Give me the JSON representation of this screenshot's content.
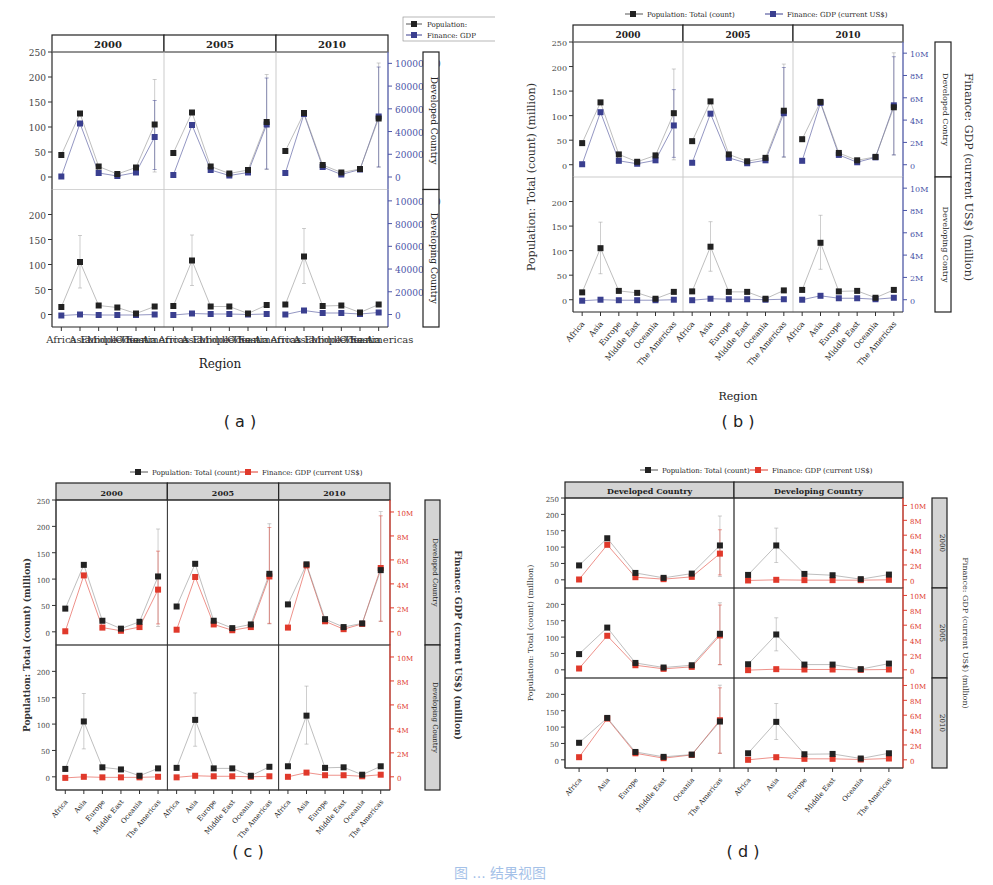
{
  "figure": {
    "captions": [
      "( a )",
      "( b )",
      "( c )",
      "( d )"
    ],
    "bottom_caption": "图 ... 结果视图"
  },
  "legend": {
    "a": [
      "Population:",
      "Finance: GDP"
    ],
    "full": [
      "Population: Total (count)",
      "Finance: GDP (current US$)"
    ]
  },
  "colors": {
    "population": "#222222",
    "gdp_blue": "#3a3f8f",
    "gdp_red": "#e0392b",
    "strip_gray": "#d4d4d4",
    "axis_blue": "#4a55a8",
    "axis_red": "#e0392b"
  },
  "chart_data": [
    {
      "id": "a",
      "type": "line",
      "title": "",
      "xlabel": "Region",
      "ylabel": "",
      "y2label": "",
      "facet_columns": [
        "2000",
        "2005",
        "2010"
      ],
      "facet_rows": [
        "Developed Country",
        "Developing Country"
      ],
      "categories": [
        "Africa",
        "Asia",
        "Europe",
        "Middle East",
        "Oceania",
        "The Americas"
      ],
      "y_ticks": [
        "0",
        "50",
        "100",
        "150",
        "200",
        "250"
      ],
      "y2_ticks": [
        "0",
        "2000000",
        "4000000",
        "6000000",
        "8000000",
        "10000000"
      ],
      "ylim": [
        -25,
        250
      ],
      "y2lim": [
        -1100000,
        11000000
      ],
      "legend_position": "top-right",
      "series_colors": {
        "population": "#222222",
        "gdp": "#3a3f8f"
      }
    },
    {
      "id": "b",
      "type": "line",
      "xlabel": "Region",
      "ylabel": "Population: Total (count) (million)",
      "y2label": "Finance: GDP (current US$) (million)",
      "facet_columns": [
        "2000",
        "2005",
        "2010"
      ],
      "facet_rows": [
        "Developed Contry",
        "Developing Contry"
      ],
      "categories": [
        "Africa",
        "Asia",
        "Europe",
        "Middle East",
        "Oceania",
        "The Americas"
      ],
      "y_ticks": [
        "0",
        "50",
        "100",
        "150",
        "200",
        "250"
      ],
      "y2_ticks": [
        "0",
        "2M",
        "4M",
        "6M",
        "8M",
        "10M"
      ],
      "ylim": [
        -25,
        250
      ],
      "legend_position": "top",
      "series_colors": {
        "population": "#222222",
        "gdp": "#3a3f8f"
      }
    },
    {
      "id": "c",
      "type": "line",
      "xlabel": "",
      "ylabel": "Population: Total (count) (million)",
      "y2label": "Finance: GDP (current US$) (million)",
      "facet_columns": [
        "2000",
        "2005",
        "2010"
      ],
      "facet_rows": [
        "Developed Country",
        "Developing Country"
      ],
      "categories": [
        "Africa",
        "Asia",
        "Europe",
        "Middle East",
        "Oceania",
        "The Americas"
      ],
      "y_ticks": [
        "0",
        "50",
        "100",
        "150",
        "200",
        "250"
      ],
      "y2_ticks": [
        "0",
        "2M",
        "4M",
        "6M",
        "8M",
        "10M"
      ],
      "ylim": [
        -25,
        250
      ],
      "legend_position": "top",
      "series_colors": {
        "population": "#222222",
        "gdp": "#e0392b"
      }
    },
    {
      "id": "d",
      "type": "line",
      "xlabel": "",
      "ylabel": "Population: Total (count) (million)",
      "y2label": "Finance: GDP (current US$) (million)",
      "facet_columns": [
        "Developed Country",
        "Developing Country"
      ],
      "facet_rows": [
        "2000",
        "2005",
        "2010"
      ],
      "categories": [
        "Africa",
        "Asia",
        "Europe",
        "Middle East",
        "Oceania",
        "The Americas"
      ],
      "y_ticks": [
        "0",
        "50",
        "100",
        "150",
        "200",
        "250"
      ],
      "y2_ticks": [
        "0",
        "2M",
        "4M",
        "6M",
        "8M",
        "10M"
      ],
      "ylim": [
        -25,
        250
      ],
      "legend_position": "top",
      "series_colors": {
        "population": "#222222",
        "gdp": "#e0392b"
      }
    }
  ],
  "values": {
    "note": "population in millions (left axis); gdp expressed on the same visual scale (250 ≈ 11M on right axis)",
    "Developed Country": {
      "2000": {
        "population": [
          44,
          127,
          21,
          6,
          19,
          105
        ],
        "gdp": [
          1,
          107,
          8,
          2,
          9,
          80
        ],
        "err_americas": [
          10,
          195
        ],
        "err_gdp_americas": [
          15,
          153
        ]
      },
      "2005": {
        "population": [
          48,
          129,
          21,
          7,
          14,
          110
        ],
        "gdp": [
          4,
          104,
          14,
          3,
          9,
          105
        ],
        "err_americas": [
          15,
          205
        ],
        "err_gdp_americas": [
          16,
          198
        ]
      },
      "2010": {
        "population": [
          52,
          128,
          24,
          9,
          16,
          117
        ],
        "gdp": [
          8,
          126,
          20,
          5,
          15,
          121
        ],
        "err_americas": [
          20,
          228
        ],
        "err_gdp_americas": [
          20,
          220
        ]
      }
    },
    "Developing Country": {
      "2000": {
        "population": [
          15,
          105,
          18,
          14,
          2,
          16
        ],
        "gdp": [
          -2,
          0,
          -1,
          -1,
          -1,
          0
        ],
        "err_asia": [
          53,
          158
        ]
      },
      "2005": {
        "population": [
          17,
          108,
          16,
          16,
          2,
          19
        ],
        "gdp": [
          -1,
          2,
          1,
          1,
          0,
          1
        ],
        "err_asia": [
          58,
          159
        ]
      },
      "2010": {
        "population": [
          20,
          116,
          17,
          18,
          4,
          20
        ],
        "gdp": [
          0,
          8,
          3,
          3,
          1,
          4
        ],
        "err_asia": [
          62,
          172
        ]
      }
    }
  }
}
